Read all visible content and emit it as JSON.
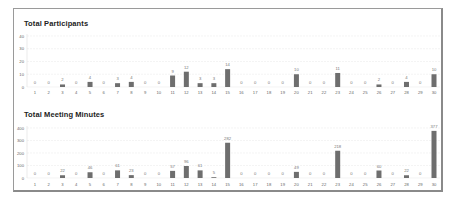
{
  "charts": {
    "participants": {
      "title": "Total Participants"
    },
    "minutes": {
      "title": "Total Meeting Minutes"
    }
  },
  "colors": {
    "bar": "#6e6e6e",
    "grid": "#ececec",
    "frame": "#8a8a8a"
  },
  "chart_data": [
    {
      "type": "bar",
      "title": "Total Participants",
      "xlabel": "",
      "ylabel": "",
      "ylim": [
        0,
        40
      ],
      "yticks": [
        0,
        10,
        20,
        30,
        40
      ],
      "grid": true,
      "categories": [
        "1",
        "2",
        "3",
        "4",
        "5",
        "6",
        "7",
        "8",
        "9",
        "10",
        "11",
        "12",
        "13",
        "14",
        "15",
        "16",
        "17",
        "18",
        "19",
        "20",
        "21",
        "22",
        "23",
        "24",
        "25",
        "26",
        "27",
        "28",
        "29",
        "30"
      ],
      "values": [
        0,
        0,
        2,
        0,
        4,
        0,
        3,
        4,
        0,
        0,
        9,
        12,
        3,
        3,
        14,
        0,
        0,
        0,
        0,
        10,
        0,
        0,
        11,
        0,
        0,
        2,
        0,
        4,
        0,
        10
      ]
    },
    {
      "type": "bar",
      "title": "Total Meeting Minutes",
      "xlabel": "",
      "ylabel": "",
      "ylim": [
        0,
        400
      ],
      "yticks": [
        0,
        100,
        200,
        300,
        400
      ],
      "grid": true,
      "categories": [
        "1",
        "2",
        "3",
        "4",
        "5",
        "6",
        "7",
        "8",
        "9",
        "10",
        "11",
        "12",
        "13",
        "14",
        "15",
        "16",
        "17",
        "18",
        "19",
        "20",
        "21",
        "22",
        "23",
        "24",
        "25",
        "26",
        "27",
        "28",
        "29",
        "30"
      ],
      "values": [
        0,
        0,
        22,
        0,
        46,
        0,
        61,
        23,
        0,
        0,
        57,
        96,
        61,
        5,
        282,
        0,
        0,
        0,
        0,
        49,
        0,
        0,
        218,
        0,
        0,
        60,
        0,
        22,
        0,
        377
      ]
    }
  ]
}
